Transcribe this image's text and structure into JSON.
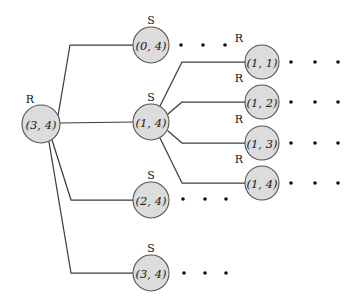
{
  "diagram": {
    "colors": {
      "node_fill": "#dcdcdc",
      "node_stroke": "#555555",
      "edge": "#3c3c3c",
      "text": "#111111",
      "background": "#ffffff"
    },
    "nodes": [
      {
        "id": "root",
        "label": "(3, 4)",
        "type": "R",
        "cx": 41,
        "cy": 124,
        "r": 19,
        "type_dx": -11,
        "type_dy": -25
      },
      {
        "id": "m0",
        "label": "(0, 4)",
        "type": "S",
        "cx": 151,
        "cy": 45,
        "r": 18,
        "type_dx": 0,
        "type_dy": -25
      },
      {
        "id": "m1",
        "label": "(1, 4)",
        "type": "S",
        "cx": 151,
        "cy": 122,
        "r": 18,
        "type_dx": 0,
        "type_dy": -25
      },
      {
        "id": "m2",
        "label": "(2, 4)",
        "type": "S",
        "cx": 151,
        "cy": 200,
        "r": 18,
        "type_dx": 0,
        "type_dy": -25
      },
      {
        "id": "m3",
        "label": "(3, 4)",
        "type": "S",
        "cx": 151,
        "cy": 273,
        "r": 18,
        "type_dx": 0,
        "type_dy": -25
      },
      {
        "id": "r1",
        "label": "(1, 1)",
        "type": "R",
        "cx": 262,
        "cy": 62,
        "r": 17,
        "type_dx": -23,
        "type_dy": -24
      },
      {
        "id": "r2",
        "label": "(1, 2)",
        "type": "R",
        "cx": 262,
        "cy": 102,
        "r": 17,
        "type_dx": -23,
        "type_dy": -24
      },
      {
        "id": "r3",
        "label": "(1, 3)",
        "type": "R",
        "cx": 262,
        "cy": 143,
        "r": 17,
        "type_dx": -23,
        "type_dy": -24
      },
      {
        "id": "r4",
        "label": "(1, 4)",
        "type": "R",
        "cx": 262,
        "cy": 183,
        "r": 17,
        "type_dx": -23,
        "type_dy": -24
      }
    ],
    "edges": [
      {
        "from": "root",
        "to": "m0",
        "points": "58,116 70,45 133,45"
      },
      {
        "from": "root",
        "to": "m1",
        "points": "60,123 133,122"
      },
      {
        "from": "root",
        "to": "m2",
        "points": "52,140 71,200 133,200"
      },
      {
        "from": "root",
        "to": "m3",
        "points": "49,142 71,273 133,273"
      },
      {
        "from": "m1",
        "to": "r1",
        "points": "160,106 182,62 245,62"
      },
      {
        "from": "m1",
        "to": "r2",
        "points": "168,114 182,102 245,102"
      },
      {
        "from": "m1",
        "to": "r3",
        "points": "168,131 182,143 245,143"
      },
      {
        "from": "m1",
        "to": "r4",
        "points": "160,138 182,183 245,183"
      }
    ],
    "ellipses": [
      {
        "id": "dots-after-0-4",
        "cy": 45,
        "xs": [
          181,
          203,
          225
        ],
        "r": 1.8
      },
      {
        "id": "dots-after-2-4",
        "cy": 199,
        "xs": [
          183,
          205,
          226
        ],
        "r": 1.8
      },
      {
        "id": "dots-after-3-4",
        "cy": 273,
        "xs": [
          184,
          205,
          226
        ],
        "r": 1.8
      },
      {
        "id": "dots-after-1-1",
        "cy": 62,
        "xs": [
          291,
          315,
          338
        ],
        "r": 1.8
      },
      {
        "id": "dots-after-1-2",
        "cy": 102,
        "xs": [
          291,
          315,
          338
        ],
        "r": 1.8
      },
      {
        "id": "dots-after-1-3",
        "cy": 143,
        "xs": [
          291,
          315,
          338
        ],
        "r": 1.8
      },
      {
        "id": "dots-after-1-4",
        "cy": 183,
        "xs": [
          291,
          315,
          338
        ],
        "r": 1.8
      }
    ]
  }
}
